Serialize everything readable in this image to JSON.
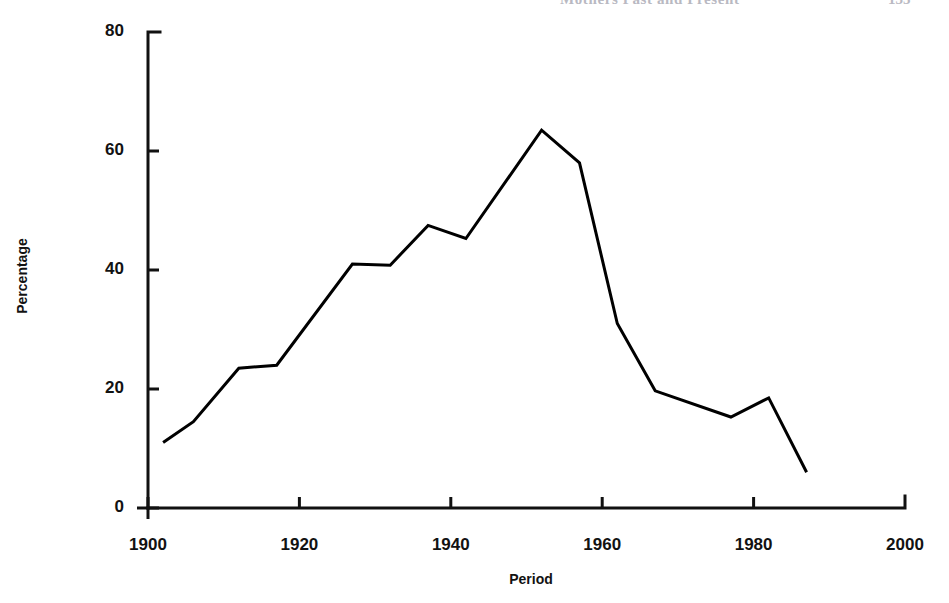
{
  "header": {
    "running_title": "Mothers Past and Present",
    "page_number": "135"
  },
  "figure": {
    "ylabel": "Percentage",
    "xlabel": "Period"
  },
  "chart_data": {
    "type": "line",
    "title": "",
    "subtitle": "",
    "xlabel": "Period",
    "ylabel": "Percentage",
    "xlim": [
      1900,
      2000
    ],
    "ylim": [
      0,
      80
    ],
    "xticks": [
      1900,
      1920,
      1940,
      1960,
      1980,
      2000
    ],
    "yticks": [
      0,
      20,
      40,
      60,
      80
    ],
    "xtick_labels": [
      "1900",
      "1920",
      "1940",
      "1960",
      "1980",
      "2000"
    ],
    "ytick_labels": [
      "0",
      "20",
      "40",
      "60",
      "80"
    ],
    "grid": false,
    "legend": false,
    "legend_position": "none",
    "line_color": "#000000",
    "line_width": 3,
    "markers": false,
    "series": [
      {
        "name": "Percentage",
        "x": [
          1902,
          1906,
          1912,
          1917,
          1927,
          1932,
          1937,
          1942,
          1952,
          1957,
          1962,
          1967,
          1977,
          1982,
          1987
        ],
        "values": [
          11.0,
          14.5,
          23.5,
          24.0,
          41.0,
          40.8,
          47.5,
          45.3,
          63.5,
          58.0,
          31.0,
          19.7,
          15.3,
          18.5,
          6.0
        ]
      }
    ]
  }
}
